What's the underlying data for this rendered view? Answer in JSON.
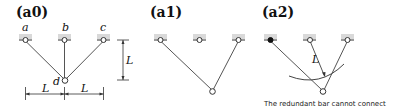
{
  "panels": [
    {
      "id": "a0",
      "title": "(a0)",
      "support_labels": [
        "a",
        "b",
        "c"
      ],
      "node_label": "d",
      "dimension_vertical": "L",
      "dimension_horizontal": [
        "L",
        "L"
      ]
    },
    {
      "id": "a1",
      "title": "(a1)"
    },
    {
      "id": "a2",
      "title": "(a2)",
      "arc_label": "L",
      "caption": "The redundant bar cannot connect"
    }
  ]
}
